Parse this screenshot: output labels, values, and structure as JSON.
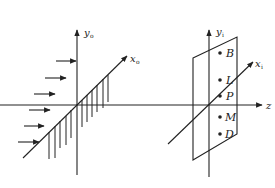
{
  "diagram": {
    "left_frame": {
      "y_axis_label": "y",
      "y_axis_sub": "o",
      "x_axis_label": "x",
      "x_axis_sub": "o",
      "incident_arrows_count": 6,
      "hatched_plane": true
    },
    "right_frame": {
      "y_axis_label": "y",
      "y_axis_sub": "i",
      "x_axis_label": "x",
      "x_axis_sub": "i",
      "points": [
        {
          "label": "B"
        },
        {
          "label": "L"
        },
        {
          "label": "P"
        },
        {
          "label": "M"
        },
        {
          "label": "D"
        }
      ]
    },
    "shared_axis": {
      "label": "z"
    },
    "colors": {
      "line": "#222222",
      "background": "#ffffff"
    }
  }
}
